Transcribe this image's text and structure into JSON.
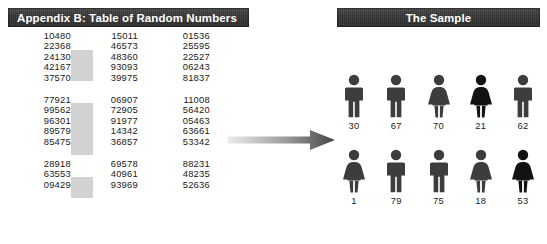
{
  "left_panel": {
    "header": "Appendix B: Table of Random Numbers",
    "blocks": [
      {
        "rows": [
          {
            "c1": "10480",
            "c2": "15011",
            "c3": "01536"
          },
          {
            "c1": "22368",
            "c2": "46573",
            "c3": "25595"
          },
          {
            "c1": "24130",
            "c2": "48360",
            "c3": "22527"
          },
          {
            "c1": "42167",
            "c2": "93093",
            "c3": "06243"
          },
          {
            "c1": "37570",
            "c2": "39975",
            "c3": "81837"
          }
        ]
      },
      {
        "rows": [
          {
            "c1": "77921",
            "c2": "06907",
            "c3": "11008"
          },
          {
            "c1": "99562",
            "c2": "72905",
            "c3": "56420"
          },
          {
            "c1": "96301",
            "c2": "91977",
            "c3": "05463"
          },
          {
            "c1": "89579",
            "c2": "14342",
            "c3": "63661"
          },
          {
            "c1": "85475",
            "c2": "36857",
            "c3": "53342"
          }
        ]
      },
      {
        "rows": [
          {
            "c1": "28918",
            "c2": "69578",
            "c3": "88231"
          },
          {
            "c1": "63553",
            "c2": "40961",
            "c3": "48235"
          },
          {
            "c1": "09429",
            "c2": "93969",
            "c3": "52636"
          }
        ]
      }
    ],
    "highlight_color": "#d2d2d2"
  },
  "arrow": {
    "name": "arrow-right",
    "gradient_from": "#e8e8e8",
    "gradient_to": "#4a4a4a"
  },
  "right_panel": {
    "header": "The Sample",
    "rows": [
      {
        "people": [
          {
            "gender": "male",
            "label": "30",
            "color": "#3d3d3d"
          },
          {
            "gender": "male",
            "label": "67",
            "color": "#3d3d3d"
          },
          {
            "gender": "female",
            "label": "70",
            "color": "#3d3d3d"
          },
          {
            "gender": "female",
            "label": "21",
            "color": "#121212"
          },
          {
            "gender": "male",
            "label": "62",
            "color": "#3d3d3d"
          }
        ]
      },
      {
        "people": [
          {
            "gender": "female",
            "label": "1",
            "color": "#3d3d3d"
          },
          {
            "gender": "male",
            "label": "79",
            "color": "#3d3d3d"
          },
          {
            "gender": "male",
            "label": "75",
            "color": "#3d3d3d"
          },
          {
            "gender": "female",
            "label": "18",
            "color": "#3d3d3d"
          },
          {
            "gender": "female",
            "label": "53",
            "color": "#121212"
          }
        ]
      }
    ]
  }
}
